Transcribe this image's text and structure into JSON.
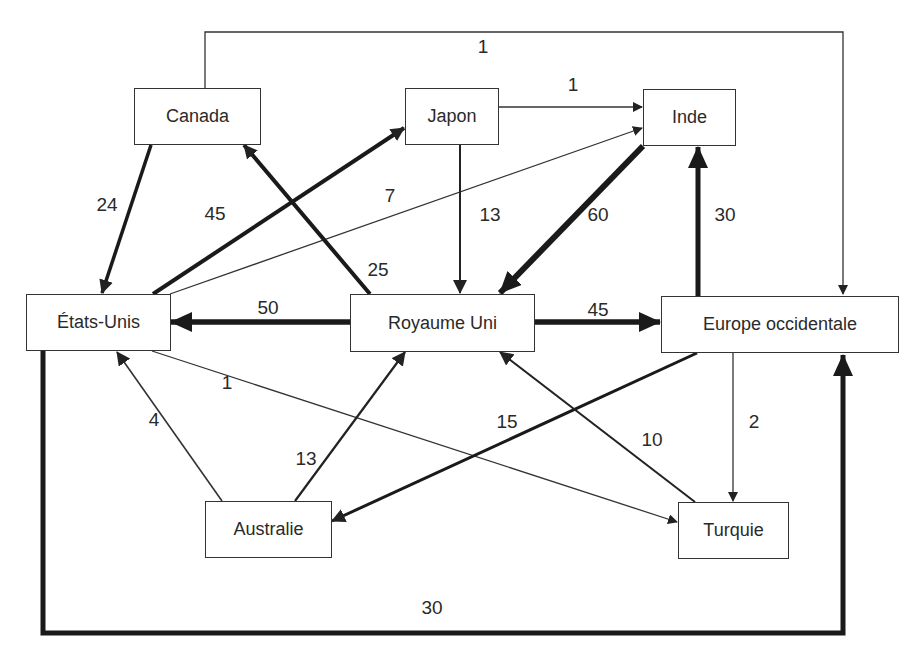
{
  "diagram": {
    "type": "flow-network",
    "nodes": [
      {
        "id": "canada",
        "label": "Canada"
      },
      {
        "id": "japon",
        "label": "Japon"
      },
      {
        "id": "inde",
        "label": "Inde"
      },
      {
        "id": "etats_unis",
        "label": "États-Unis"
      },
      {
        "id": "royaume_uni",
        "label": "Royaume Uni"
      },
      {
        "id": "europe",
        "label": "Europe occidentale"
      },
      {
        "id": "australie",
        "label": "Australie"
      },
      {
        "id": "turquie",
        "label": "Turquie"
      }
    ],
    "edges": [
      {
        "from": "Canada",
        "to": "Europe occidentale",
        "value": "1"
      },
      {
        "from": "Japon",
        "to": "Inde",
        "value": "1"
      },
      {
        "from": "Canada",
        "to": "États-Unis",
        "value": "24"
      },
      {
        "from": "États-Unis",
        "to": "Japon",
        "value": "45"
      },
      {
        "from": "États-Unis",
        "to": "Inde",
        "value": "7"
      },
      {
        "from": "Japon",
        "to": "Royaume Uni",
        "value": "13"
      },
      {
        "from": "Inde",
        "to": "Royaume Uni",
        "value": "60"
      },
      {
        "from": "Europe occidentale",
        "to": "Inde",
        "value": "30"
      },
      {
        "from": "Royaume Uni",
        "to": "Canada",
        "value": "25"
      },
      {
        "from": "Royaume Uni",
        "to": "États-Unis",
        "value": "50"
      },
      {
        "from": "Royaume Uni",
        "to": "Europe occidentale",
        "value": "45"
      },
      {
        "from": "États-Unis",
        "to": "Turquie",
        "value": "1"
      },
      {
        "from": "Australie",
        "to": "États-Unis",
        "value": "4"
      },
      {
        "from": "Australie",
        "to": "Royaume Uni",
        "value": "13"
      },
      {
        "from": "Europe occidentale",
        "to": "Australie",
        "value": "15"
      },
      {
        "from": "Turquie",
        "to": "Royaume Uni",
        "value": "10"
      },
      {
        "from": "Europe occidentale",
        "to": "Turquie",
        "value": "2"
      },
      {
        "from": "États-Unis",
        "to": "Europe occidentale",
        "value": "30"
      }
    ]
  }
}
